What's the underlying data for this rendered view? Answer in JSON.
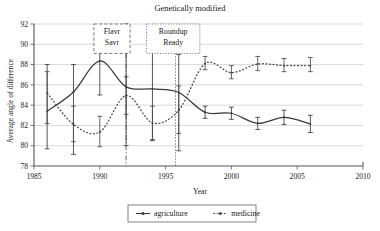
{
  "chart_data": {
    "type": "line",
    "title": "Genetically modified",
    "xlabel": "Year",
    "ylabel": "Average angle of difference",
    "xlim": [
      1985,
      2010
    ],
    "ylim": [
      78,
      92
    ],
    "xticks": [
      1985,
      1990,
      1995,
      2000,
      2005,
      2010
    ],
    "yticks": [
      78,
      80,
      82,
      84,
      86,
      88,
      90,
      92
    ],
    "grid": "horizontal",
    "legend_position": "bottom",
    "series": [
      {
        "name": "agriculture",
        "style": "solid",
        "color": "#3a3a3a",
        "x": [
          1986,
          1988,
          1990,
          1992,
          1994,
          1996,
          1998,
          2000,
          2002,
          2004,
          2006
        ],
        "values": [
          83.4,
          85.3,
          88.35,
          85.8,
          85.6,
          85.25,
          83.3,
          83.2,
          82.2,
          82.8,
          82.15
        ],
        "err_low": [
          79.7,
          79.15,
          85.0,
          80.0,
          80.5,
          79.5,
          82.7,
          82.6,
          81.6,
          82.1,
          81.3
        ],
        "err_high": [
          88.0,
          88.0,
          89.2,
          92.0,
          90.5,
          89.0,
          83.9,
          83.8,
          82.8,
          83.5,
          83.0
        ]
      },
      {
        "name": "medicine",
        "style": "dotted",
        "color": "#4a4a4a",
        "x": [
          1986,
          1988,
          1990,
          1992,
          1994,
          1996,
          1998,
          2000,
          2002,
          2004,
          2006
        ],
        "values": [
          85.2,
          82.1,
          81.35,
          84.95,
          82.25,
          83.5,
          88.1,
          87.2,
          88.05,
          87.9,
          87.9
        ],
        "err_low": [
          82.2,
          80.4,
          79.9,
          83.1,
          80.6,
          81.2,
          87.5,
          86.6,
          87.4,
          87.3,
          87.3
        ],
        "err_high": [
          87.3,
          83.9,
          82.9,
          86.8,
          83.9,
          85.9,
          88.8,
          87.9,
          88.8,
          88.6,
          88.7
        ]
      }
    ],
    "annotations": [
      {
        "label_line1": "Flavr",
        "label_line2": "Savr",
        "x": 1992,
        "border": "dashed",
        "box_x0": 1989.55,
        "box_x1": 1992.3,
        "box_y_top": 92.0,
        "box_y_bottom": 89.1
      },
      {
        "label_line1": "Roundup",
        "label_line2": "Ready",
        "x": 1995.75,
        "border": "dotted",
        "box_x0": 1993.55,
        "box_x1": 1997.6,
        "box_y_top": 92.0,
        "box_y_bottom": 89.1
      }
    ]
  }
}
